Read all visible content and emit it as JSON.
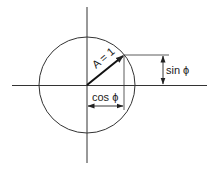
{
  "diagram": {
    "colors": {
      "stroke": "#333333",
      "background": "#ffffff"
    },
    "axes": {
      "origin": [
        87,
        85
      ],
      "x_range": [
        12,
        207
      ],
      "y_range": [
        7,
        163
      ]
    },
    "circle": {
      "cx": 87,
      "cy": 85,
      "r": 48
    },
    "vector": {
      "label": "A = 1",
      "from": [
        87,
        85
      ],
      "to": [
        124,
        55
      ]
    },
    "labels": {
      "vector": "A = 1",
      "sin": "sin ϕ",
      "cos": "cos ϕ"
    },
    "dimensions": {
      "sin": {
        "x": 163,
        "y_from": 55,
        "y_to": 85,
        "label": "sin ϕ"
      },
      "cos": {
        "y": 106,
        "x_from": 87,
        "x_to": 124,
        "label": "cos ϕ"
      }
    }
  }
}
